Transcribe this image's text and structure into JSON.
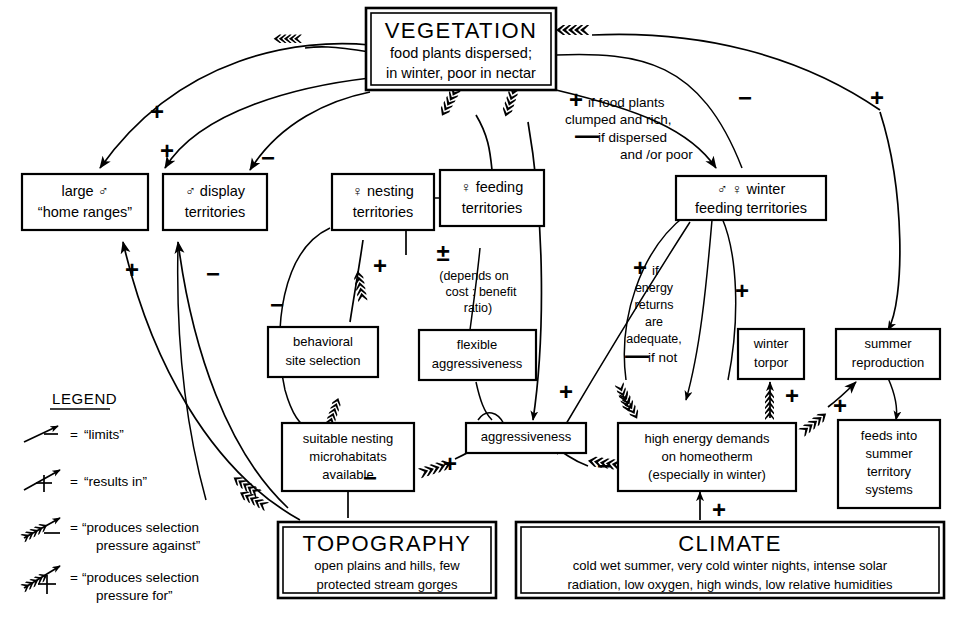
{
  "diagram": {
    "nodes": {
      "vegetation": {
        "heading": "VEGETATION",
        "line1": "food plants dispersed;",
        "line2": "in winter, poor in nectar"
      },
      "home_ranges": {
        "line1": "large ♂",
        "line2": "“home ranges”"
      },
      "display_territories": {
        "line1": "♂ display",
        "line2": "territories"
      },
      "nesting_territories": {
        "line1": "♀ nesting",
        "line2": "territories"
      },
      "feeding_territories": {
        "line1": "♀ feeding",
        "line2": "territories"
      },
      "winter_feeding": {
        "line1": "♂ ♀   winter",
        "line2": "feeding territories"
      },
      "behavioral_site": {
        "line1": "behavioral",
        "line2": "site selection"
      },
      "flexible_aggr": {
        "line1": "flexible",
        "line2": "aggressiveness"
      },
      "winter_torpor": {
        "line1": "winter",
        "line2": "torpor"
      },
      "summer_reproduction": {
        "line1": "summer",
        "line2": "reproduction"
      },
      "suitable_nesting": {
        "line1": "suitable nesting",
        "line2": "microhabitats",
        "line3": "available"
      },
      "aggressiveness": {
        "line1": "aggressiveness"
      },
      "high_energy": {
        "line1": "high energy demands",
        "line2": "on homeotherm",
        "line3": "(especially in winter)"
      },
      "feeds_into": {
        "line1": "feeds into",
        "line2": "summer",
        "line3": "territory",
        "line4": "systems"
      },
      "topography": {
        "heading": "TOPOGRAPHY",
        "line1": "open plains and hills, few",
        "line2": "protected stream gorges"
      },
      "climate": {
        "heading": "CLIMATE",
        "line1": "cold  wet  summer, very cold winter nights, intense solar",
        "line2": "radiation, low oxygen, high winds, low relative humidities"
      }
    },
    "link_label": "link",
    "annotations": {
      "food_plants": {
        "l1_sign": "+",
        "l1_text": "if food plants",
        "l2_text": "clumped and rich,",
        "l3_sign": "—",
        "l3_text": "if dispersed",
        "l4_text": "and /or poor"
      },
      "cost_benefit": {
        "sign": "±",
        "l1": "(depends on",
        "l2": "cost : benefit",
        "l3": "ratio)"
      },
      "energy_returns": {
        "l1_sign": "+",
        "l1_text": "if",
        "l2": "energy",
        "l3": "returns",
        "l4": "are",
        "l5": "adequate,",
        "l6_sign": "—",
        "l6_text": "if not"
      }
    },
    "edge_signs": [
      {
        "id": "veg-to-home-ranges",
        "sign": "+"
      },
      {
        "id": "veg-to-display",
        "sign": "+"
      },
      {
        "id": "veg-to-nesting",
        "sign": "−"
      },
      {
        "id": "veg-right-minus",
        "sign": "−"
      },
      {
        "id": "veg-far-right-plus",
        "sign": "+"
      },
      {
        "id": "topo-to-home-ranges",
        "sign": "+"
      },
      {
        "id": "topo-to-display",
        "sign": "−"
      },
      {
        "id": "nesting-loop-minus",
        "sign": "−"
      },
      {
        "id": "behavioral-to-nesting",
        "sign": "+"
      },
      {
        "id": "topo-to-suitable",
        "sign": "−"
      },
      {
        "id": "suitable-to-aggressiveness",
        "sign": "+"
      },
      {
        "id": "energy-to-aggressiveness",
        "sign": "−"
      },
      {
        "id": "climate-to-energy",
        "sign": "+"
      },
      {
        "id": "energy-to-torpor",
        "sign": "+"
      },
      {
        "id": "energy-to-summer-repro",
        "sign": "+"
      },
      {
        "id": "winter-feeding-down",
        "sign": "+"
      },
      {
        "id": "flexible-to-aggressiveness",
        "sign": "+"
      }
    ],
    "legend": {
      "title": "LEGEND",
      "items": [
        {
          "icon": "plain-arrow-minus",
          "eq": "=",
          "text": "“limits”"
        },
        {
          "icon": "plain-arrow-plus",
          "eq": "=",
          "text": "“results in”"
        },
        {
          "icon": "feathered-arrow-minus",
          "eq": "=",
          "text_l1": "“produces selection",
          "text_l2": "pressure against”"
        },
        {
          "icon": "feathered-arrow-plus",
          "eq": "=",
          "text_l1": "“produces selection",
          "text_l2": "pressure for”"
        }
      ]
    },
    "colors": {
      "ink": "#000000",
      "paper": "#ffffff"
    }
  }
}
